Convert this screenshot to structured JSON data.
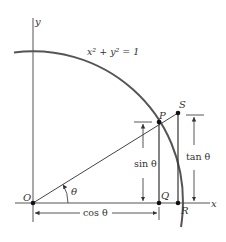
{
  "diagram": {
    "equation": "x² + y² = 1",
    "axes": {
      "x_label": "x",
      "y_label": "y"
    },
    "points": {
      "origin": "O",
      "P": "P",
      "Q": "Q",
      "R": "R",
      "S": "S"
    },
    "angle_label": "θ",
    "measures": {
      "cos": "cos θ",
      "sin": "sin θ",
      "tan": "tan θ"
    },
    "colors": {
      "curve": "#555555",
      "lines": "#333333",
      "text": "#333333"
    }
  }
}
